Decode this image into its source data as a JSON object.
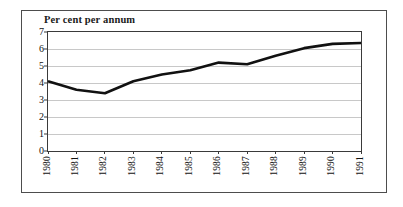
{
  "figure": {
    "title": "Per cent per annum",
    "background_color": "#ffffff",
    "border_color": "#4d4d4d",
    "line_color": "#111111",
    "grid_color": "#c8c8c8"
  },
  "chart_data": {
    "type": "line",
    "title": "Per cent per annum",
    "xlabel": "",
    "ylabel": "",
    "categories": [
      "1980",
      "1981",
      "1982",
      "1983",
      "1984",
      "1985",
      "1986",
      "1987",
      "1988",
      "1989",
      "1990",
      "1991"
    ],
    "x": [
      1980,
      1981,
      1982,
      1983,
      1984,
      1985,
      1986,
      1987,
      1988,
      1989,
      1990,
      1991
    ],
    "values": [
      4.1,
      3.6,
      3.4,
      4.1,
      4.5,
      4.75,
      5.2,
      5.1,
      5.6,
      6.05,
      6.3,
      6.35
    ],
    "series": [
      {
        "name": "Per cent per annum",
        "values": [
          4.1,
          3.6,
          3.4,
          4.1,
          4.5,
          4.75,
          5.2,
          5.1,
          5.6,
          6.05,
          6.3,
          6.35
        ]
      }
    ],
    "ylim": [
      0,
      7
    ],
    "yticks": [
      0,
      1,
      2,
      3,
      4,
      5,
      6,
      7
    ],
    "ytick_labels": [
      "0",
      "1",
      "2",
      "3",
      "4",
      "5",
      "6",
      "7"
    ],
    "grid": true,
    "grid_axis": "y",
    "legend": false,
    "legend_position": "none",
    "line_width": 2.6,
    "markers": false
  }
}
